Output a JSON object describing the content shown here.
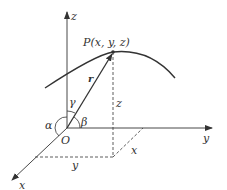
{
  "diagram": {
    "colors": {
      "stroke": "#333333",
      "background": "#ffffff"
    },
    "axes": {
      "x": {
        "label": "x"
      },
      "y": {
        "label": "y"
      },
      "z": {
        "label": "z"
      }
    },
    "origin_label": "O",
    "point_label": "P(x, y, z)",
    "vector_label": "r",
    "angles": {
      "alpha": "α",
      "beta": "β",
      "gamma": "γ"
    },
    "projection_labels": {
      "z": "z",
      "x": "x",
      "y": "y"
    }
  }
}
